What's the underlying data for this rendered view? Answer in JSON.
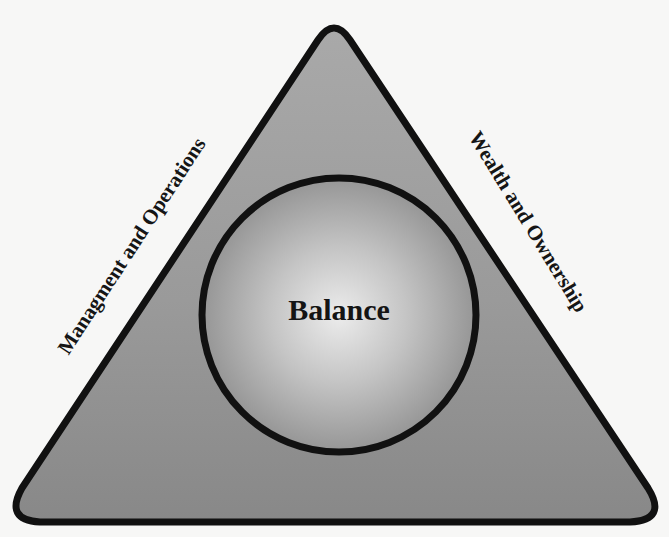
{
  "diagram": {
    "center": {
      "label": "Balance"
    },
    "sides": {
      "left": {
        "label": "Managment and Operations"
      },
      "right": {
        "label": "Wealth and Ownership"
      }
    },
    "colors": {
      "background": "#f7f7f6",
      "outline": "#111111",
      "triangle_fill_top": "#a8a8a8",
      "triangle_fill_bottom": "#8a8a8a",
      "circle_fill_center": "#e6e6e6",
      "circle_fill_edge": "#8e8e8e",
      "text": "#141414"
    }
  }
}
